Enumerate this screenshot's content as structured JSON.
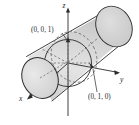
{
  "figure": {
    "background_color": "#ffffff",
    "surface_fill": "#d9d9d9",
    "surface_fill_light": "#e6e6e6",
    "surface_fill_dark": "#c9c9c9",
    "outline_color": "#2b2b2b",
    "dash_color": "#6e6e6e",
    "axes": [
      {
        "name": "z-axis",
        "label": "z",
        "direction": "up"
      },
      {
        "name": "y-axis",
        "label": "y",
        "direction": "right"
      },
      {
        "name": "x-axis",
        "label": "x",
        "direction": "front-left"
      }
    ],
    "points": [
      {
        "name": "point-top",
        "label": "(0, 0, 1)"
      },
      {
        "name": "point-right",
        "label": "(0, 1, 0)"
      }
    ]
  }
}
